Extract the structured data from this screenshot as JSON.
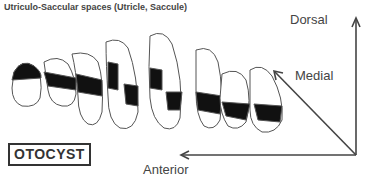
{
  "title": "Utriculo-Saccular spaces (Utricle, Saccule)",
  "box_label": "OTOCYST",
  "axes": {
    "dorsal": "Dorsal",
    "medial": "Medial",
    "anterior": "Anterior"
  },
  "colors": {
    "line": "#444444",
    "band": "#111111",
    "background": "#ffffff"
  },
  "sections_count": 9
}
